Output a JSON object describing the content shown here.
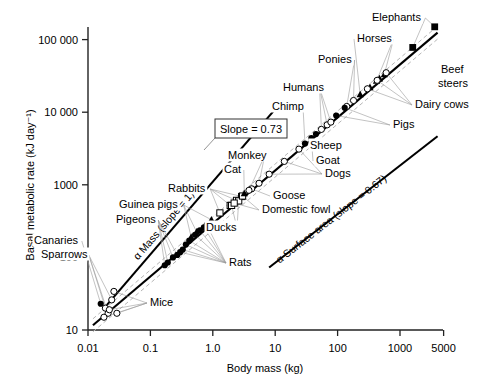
{
  "figure": {
    "name": "basal-metabolic-rate-vs-body-mass",
    "background": "#ffffff",
    "ink": "#000000",
    "leader_color": "#999999",
    "band_color": "#bbbbbb"
  },
  "chart_data": {
    "type": "scatter",
    "title": "",
    "xlabel": "Body mass (kg)",
    "ylabel": "Basal metabolic rate (kJ day⁻¹)",
    "xscale": "log",
    "yscale": "log",
    "xlim": [
      0.008,
      5000
    ],
    "ylim": [
      8,
      200000
    ],
    "grid": false,
    "legend": "none",
    "xticks": [
      {
        "value": 0.01,
        "label": "0.01"
      },
      {
        "value": 0.1,
        "label": "0.1"
      },
      {
        "value": 1.0,
        "label": "1.0"
      },
      {
        "value": 10,
        "label": "10"
      },
      {
        "value": 100,
        "label": "100"
      },
      {
        "value": 1000,
        "label": "1000"
      },
      {
        "value": 5000,
        "label": "5000"
      }
    ],
    "yticks": [
      {
        "value": 10,
        "label": "10"
      },
      {
        "value": 100,
        "label": "100"
      },
      {
        "value": 1000,
        "label": "1000"
      },
      {
        "value": 10000,
        "label": "10 000"
      },
      {
        "value": 100000,
        "label": "100 000"
      }
    ],
    "fit": {
      "label": "Slope = 0.73",
      "slope": 0.73,
      "intercept_kj_at_1kg": 293,
      "x_from": 0.012,
      "x_to": 4000,
      "confidence_band": true
    },
    "reference_lines": [
      {
        "name": "mass-proportional-line",
        "label": "α Mass (slope = 1)",
        "slope": 1.0,
        "x_from": 0.02,
        "x_to": 11,
        "label_rotation": -47
      },
      {
        "name": "surface-area-line",
        "label": "α Surface area (slope = 0.67)",
        "slope": 0.67,
        "x_from": 8,
        "x_to": 4000,
        "label_rotation": -35
      }
    ],
    "markers": {
      "filled-circle": "mammals (filled circle)",
      "open-circle": "open circle",
      "filled-triangle": "filled triangle",
      "open-square": "open square",
      "filled-square": "filled square"
    },
    "series": [
      {
        "name": "Canaries",
        "label": "Canaries",
        "marker": "filled-circle",
        "points": [
          [
            0.016,
            23
          ]
        ]
      },
      {
        "name": "Sparrows",
        "label": "Sparrows",
        "marker": "open-circle",
        "points": [
          [
            0.019,
            20
          ],
          [
            0.021,
            17
          ],
          [
            0.024,
            26
          ]
        ]
      },
      {
        "name": "Mice",
        "label": "Mice",
        "marker": "open-circle",
        "points": [
          [
            0.018,
            15
          ],
          [
            0.022,
            19
          ],
          [
            0.026,
            34
          ],
          [
            0.029,
            17
          ]
        ]
      },
      {
        "name": "Pigeons",
        "label": "Pigeons",
        "marker": "filled-circle",
        "points": [
          [
            0.17,
            78
          ],
          [
            0.19,
            85
          ],
          [
            0.23,
            100
          ],
          [
            0.27,
            108
          ]
        ]
      },
      {
        "name": "Rats",
        "label": "Rats",
        "marker": "filled-circle",
        "points": [
          [
            0.3,
            118
          ],
          [
            0.33,
            128
          ],
          [
            0.37,
            150
          ],
          [
            0.42,
            170
          ],
          [
            0.52,
            205
          ],
          [
            0.62,
            235
          ],
          [
            0.72,
            260
          ],
          [
            0.8,
            280
          ]
        ]
      },
      {
        "name": "Guinea pigs",
        "label": "Guinea pigs",
        "marker": "filled-triangle",
        "points": [
          [
            0.45,
            190
          ],
          [
            0.55,
            225
          ],
          [
            0.95,
            330
          ]
        ]
      },
      {
        "name": "Rabbits",
        "label": "Rabbits",
        "marker": "open-square",
        "points": [
          [
            1.3,
            410
          ],
          [
            1.9,
            520
          ],
          [
            2.4,
            610
          ],
          [
            2.9,
            690
          ]
        ]
      },
      {
        "name": "Ducks",
        "label": "Ducks",
        "marker": "open-square",
        "points": [
          [
            2.0,
            520
          ],
          [
            2.6,
            600
          ]
        ]
      },
      {
        "name": "Domestic fowl",
        "label": "Domestic fowl",
        "marker": "open-square",
        "points": [
          [
            2.2,
            560
          ],
          [
            3.0,
            700
          ]
        ]
      },
      {
        "name": "Goose",
        "label": "Goose",
        "marker": "open-circle",
        "points": [
          [
            4.2,
            880
          ]
        ]
      },
      {
        "name": "Cat",
        "label": "Cat",
        "marker": "filled-triangle",
        "points": [
          [
            3.2,
            760
          ]
        ]
      },
      {
        "name": "Monkey",
        "label": "Monkey",
        "marker": "open-circle",
        "points": [
          [
            3.8,
            840
          ],
          [
            5.5,
            1050
          ]
        ]
      },
      {
        "name": "Dogs",
        "label": "Dogs",
        "marker": "open-circle",
        "points": [
          [
            8,
            1400
          ],
          [
            14,
            2100
          ],
          [
            24,
            3100
          ]
        ]
      },
      {
        "name": "Chimp",
        "label": "Chimp",
        "marker": "filled-circle",
        "points": [
          [
            30,
            3700
          ]
        ]
      },
      {
        "name": "Humans",
        "label": "Humans",
        "marker": "open-circle",
        "points": [
          [
            55,
            5800
          ],
          [
            68,
            6700
          ],
          [
            78,
            7300
          ]
        ]
      },
      {
        "name": "Sheep",
        "label": "Sheep",
        "marker": "filled-circle",
        "points": [
          [
            45,
            5000
          ]
        ]
      },
      {
        "name": "Goat",
        "label": "Goat",
        "marker": "filled-circle",
        "points": [
          [
            38,
            4400
          ]
        ]
      },
      {
        "name": "Ponies",
        "label": "Ponies",
        "marker": "open-circle",
        "points": [
          [
            140,
            12000
          ],
          [
            180,
            14500
          ]
        ]
      },
      {
        "name": "Pigs",
        "label": "Pigs",
        "marker": "filled-circle",
        "points": [
          [
            95,
            9000
          ],
          [
            130,
            11500
          ]
        ]
      },
      {
        "name": "Horses",
        "label": "Horses",
        "marker": "filled-triangle",
        "points": [
          [
            230,
            17500
          ],
          [
            420,
            27000
          ],
          [
            560,
            33000
          ]
        ]
      },
      {
        "name": "Beef steers",
        "label": "Beef steers",
        "marker": "filled-triangle",
        "points": [
          [
            330,
            22000
          ],
          [
            470,
            29000
          ]
        ]
      },
      {
        "name": "Dairy cows",
        "label": "Dairy cows",
        "marker": "open-circle",
        "points": [
          [
            300,
            21000
          ],
          [
            430,
            27500
          ],
          [
            600,
            35000
          ]
        ]
      },
      {
        "name": "Elephants",
        "label": "Elephants",
        "marker": "filled-square",
        "points": [
          [
            1600,
            78000
          ],
          [
            3600,
            150000
          ]
        ]
      }
    ],
    "annotations": [
      {
        "name": "label-canaries",
        "text": "Canaries",
        "x": 34,
        "y": 244,
        "anchor": "start"
      },
      {
        "name": "label-sparrows",
        "text": "Sparrows",
        "x": 41,
        "y": 258,
        "anchor": "start"
      },
      {
        "name": "label-mice",
        "text": "Mice",
        "x": 150,
        "y": 306,
        "anchor": "start"
      },
      {
        "name": "label-pigeons",
        "text": "Pigeons",
        "x": 116,
        "y": 223,
        "anchor": "start"
      },
      {
        "name": "label-guinea-pigs",
        "text": "Guinea pigs",
        "x": 119,
        "y": 208,
        "anchor": "start"
      },
      {
        "name": "label-rabbits",
        "text": "Rabbits",
        "x": 168,
        "y": 192,
        "anchor": "start"
      },
      {
        "name": "label-rats",
        "text": "Rats",
        "x": 229,
        "y": 266,
        "anchor": "start"
      },
      {
        "name": "label-ducks",
        "text": "Ducks",
        "x": 206,
        "y": 231,
        "anchor": "start"
      },
      {
        "name": "label-domestic-fowl",
        "text": "Domestic fowl",
        "x": 262,
        "y": 213,
        "anchor": "start"
      },
      {
        "name": "label-goose",
        "text": "Goose",
        "x": 273,
        "y": 199,
        "anchor": "start"
      },
      {
        "name": "label-cat",
        "text": "Cat",
        "x": 224,
        "y": 173,
        "anchor": "start"
      },
      {
        "name": "label-monkey",
        "text": "Monkey",
        "x": 228,
        "y": 159,
        "anchor": "start"
      },
      {
        "name": "label-dogs",
        "text": "Dogs",
        "x": 325,
        "y": 177,
        "anchor": "start"
      },
      {
        "name": "label-goat",
        "text": "Goat",
        "x": 316,
        "y": 164,
        "anchor": "start"
      },
      {
        "name": "label-sheep",
        "text": "Sheep",
        "x": 310,
        "y": 149,
        "anchor": "start"
      },
      {
        "name": "label-chimp",
        "text": "Chimp",
        "x": 272,
        "y": 110,
        "anchor": "start"
      },
      {
        "name": "label-humans",
        "text": "Humans",
        "x": 283,
        "y": 91,
        "anchor": "start"
      },
      {
        "name": "label-ponies",
        "text": "Ponies",
        "x": 318,
        "y": 63,
        "anchor": "start"
      },
      {
        "name": "label-horses",
        "text": "Horses",
        "x": 357,
        "y": 42,
        "anchor": "start"
      },
      {
        "name": "label-elephants",
        "text": "Elephants",
        "x": 372,
        "y": 21,
        "anchor": "start"
      },
      {
        "name": "label-pigs",
        "text": "Pigs",
        "x": 393,
        "y": 128,
        "anchor": "start"
      },
      {
        "name": "label-beef",
        "text": "Beef",
        "x": 441,
        "y": 73,
        "anchor": "start"
      },
      {
        "name": "label-steers",
        "text": "steers",
        "x": 438,
        "y": 87,
        "anchor": "start"
      },
      {
        "name": "label-dairy-cows",
        "text": "Dairy cows",
        "x": 415,
        "y": 108,
        "anchor": "start"
      }
    ]
  }
}
